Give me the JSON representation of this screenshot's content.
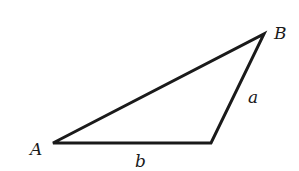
{
  "diagram": {
    "type": "triangle",
    "stroke_color": "#1a1a1a",
    "background": "#ffffff",
    "vertices": {
      "A": {
        "label": "A",
        "x": 53,
        "y": 143
      },
      "C": {
        "label": "",
        "x": 211,
        "y": 143
      },
      "B": {
        "label": "B",
        "x": 264,
        "y": 34
      }
    },
    "sides": {
      "a": {
        "label": "a",
        "from": "C",
        "to": "B"
      },
      "b": {
        "label": "b",
        "from": "A",
        "to": "C"
      }
    },
    "labels": {
      "vertex_A": "A",
      "vertex_B": "B",
      "side_a": "a",
      "side_b": "b"
    }
  }
}
